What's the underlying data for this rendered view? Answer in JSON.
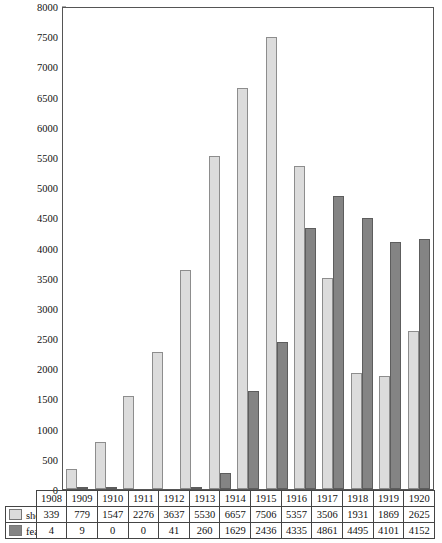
{
  "chart_data": {
    "type": "bar",
    "title": "",
    "xlabel": "",
    "ylabel": "",
    "ylim": [
      0,
      8000
    ],
    "grid": false,
    "legend_position": "table-left",
    "categories": [
      "1908",
      "1909",
      "1910",
      "1911",
      "1912",
      "1913",
      "1914",
      "1915",
      "1916",
      "1917",
      "1918",
      "1919",
      "1920"
    ],
    "yticks": [
      0,
      500,
      1000,
      1500,
      2000,
      2500,
      3000,
      3500,
      4000,
      4500,
      5000,
      5500,
      6000,
      6500,
      7000,
      7500,
      8000
    ],
    "ytick_labels": [
      "0",
      "500",
      "1000",
      "1500",
      "2000",
      "2500",
      "3000",
      "3500",
      "4000",
      "4500",
      "5000",
      "5500",
      "6000",
      "6500",
      "7000",
      "7500",
      "8000"
    ],
    "series": [
      {
        "name": "shorts",
        "color": "#dcdcdc",
        "values": [
          339,
          779,
          1547,
          2276,
          3637,
          5530,
          6657,
          7506,
          5357,
          3506,
          1931,
          1869,
          2625
        ]
      },
      {
        "name": "features",
        "color": "#848484",
        "values": [
          4,
          9,
          0,
          0,
          41,
          260,
          1629,
          2436,
          4335,
          4861,
          4495,
          4101,
          4152
        ]
      }
    ]
  },
  "table": {
    "year_header": [
      "1908",
      "1909",
      "1910",
      "1911",
      "1912",
      "1913",
      "1914",
      "1915",
      "1916",
      "1917",
      "1918",
      "1919",
      "1920"
    ],
    "rows": [
      {
        "label": "shorts",
        "swatch": "light",
        "values": [
          "339",
          "779",
          "1547",
          "2276",
          "3637",
          "5530",
          "6657",
          "7506",
          "5357",
          "3506",
          "1931",
          "1869",
          "2625"
        ]
      },
      {
        "label": "features",
        "swatch": "dark",
        "values": [
          "4",
          "9",
          "0",
          "0",
          "41",
          "260",
          "1629",
          "2436",
          "4335",
          "4861",
          "4495",
          "4101",
          "4152"
        ]
      }
    ]
  },
  "caption": {
    "text": ""
  },
  "colors": {
    "shorts": "#dcdcdc",
    "features": "#848484",
    "axis": "#555555",
    "text": "#111111"
  }
}
